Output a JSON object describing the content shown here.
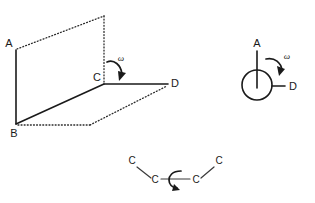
{
  "figure": {
    "background_color": "#ffffff",
    "line_color": "#1a1a1a",
    "width": 315,
    "height": 203
  },
  "panel_planes": {
    "name": "two-plane-dihedral-diagram",
    "labels": {
      "a": "A",
      "b": "B",
      "c": "C",
      "d": "D",
      "omega": "ω"
    },
    "points": {
      "a": [
        16,
        50
      ],
      "b": [
        16,
        124
      ],
      "c": [
        104,
        83
      ],
      "d": [
        168,
        84
      ],
      "plane_top_right": [
        104,
        15
      ],
      "plane_bottom_right": [
        90,
        124
      ],
      "plane_far_right": [
        168,
        84
      ]
    },
    "solid_edges": [
      "A-B",
      "B-C",
      "C-D"
    ],
    "dotted_edges": [
      "A-top-right",
      "top-right-C",
      "B-bottom-right",
      "bottom-right-D"
    ],
    "rotation_direction": "clockwise"
  },
  "panel_newman": {
    "name": "newman-projection-diagram",
    "labels": {
      "a": "A",
      "d": "D",
      "omega": "ω"
    },
    "circle": {
      "cx": 257,
      "cy": 85,
      "r": 15
    },
    "bond_a": {
      "from": [
        257,
        51
      ],
      "to": [
        257,
        88
      ]
    },
    "bond_d": {
      "from": [
        272,
        86
      ],
      "to": [
        285,
        86
      ]
    },
    "rotation_direction": "clockwise"
  },
  "panel_chain": {
    "name": "carbon-chain-rotation-diagram",
    "atoms": [
      {
        "label": "C",
        "x": 132,
        "y": 164
      },
      {
        "label": "C",
        "x": 155,
        "y": 182
      },
      {
        "label": "C",
        "x": 196,
        "y": 182
      },
      {
        "label": "C",
        "x": 219,
        "y": 164
      }
    ],
    "bonds": [
      {
        "from": 0,
        "to": 1
      },
      {
        "from": 1,
        "to": 2
      },
      {
        "from": 2,
        "to": 3
      }
    ],
    "rotation_direction": "about-central-bond"
  }
}
